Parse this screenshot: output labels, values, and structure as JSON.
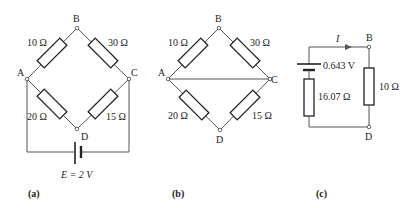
{
  "figure_a": {
    "caption": "(a)",
    "nodes": {
      "A": "A",
      "B": "B",
      "C": "C",
      "D": "D"
    },
    "resistors": {
      "AB": "10 Ω",
      "BC": "30 Ω",
      "AD": "20 Ω",
      "DC": "15 Ω"
    },
    "source": "E = 2 V"
  },
  "figure_b": {
    "caption": "(b)",
    "nodes": {
      "A": "A",
      "B": "B",
      "C": "C",
      "D": "D"
    },
    "resistors": {
      "AB": "10 Ω",
      "BC": "30 Ω",
      "AD": "20 Ω",
      "DC": "15 Ω"
    },
    "short": "A–C shorted"
  },
  "figure_c": {
    "caption": "(c)",
    "nodes": {
      "B": "B",
      "D": "D"
    },
    "current_label": "I",
    "source_voltage": "0.643 V",
    "internal_resistance": "16.07 Ω",
    "load_resistor": "10 Ω"
  }
}
